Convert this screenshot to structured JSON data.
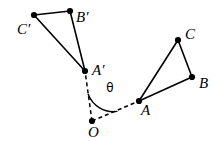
{
  "figure": {
    "background_color": "#ffffff",
    "stroke_color": "#000000",
    "width": 219,
    "height": 141
  },
  "labels": {
    "c_prime": "C′",
    "b_prime": "B′",
    "a_prime": "A′",
    "c": "C",
    "b": "B",
    "a": "A",
    "o": "O",
    "theta": "θ"
  },
  "points": {
    "C_prime": {
      "x": 34,
      "y": 15,
      "label": "C′",
      "label_x": 17,
      "label_y": 31
    },
    "B_prime": {
      "x": 70,
      "y": 11,
      "label": "B′",
      "label_x": 76,
      "label_y": 19
    },
    "A_prime": {
      "x": 85,
      "y": 71,
      "label": "A′",
      "label_x": 92,
      "label_y": 72
    },
    "C": {
      "x": 178,
      "y": 40,
      "label": "C",
      "label_x": 185,
      "label_y": 36
    },
    "B": {
      "x": 192,
      "y": 77,
      "label": "B",
      "label_x": 199,
      "label_y": 85
    },
    "A": {
      "x": 139,
      "y": 101,
      "label": "A",
      "label_x": 141,
      "label_y": 112
    },
    "O": {
      "x": 92,
      "y": 121,
      "label": "O",
      "label_x": 88,
      "label_y": 134
    }
  },
  "shapes": {
    "image_triangle": {
      "name": "triangle-a-prime-b-prime-c-prime",
      "vertices": [
        "A_prime",
        "B_prime",
        "C_prime"
      ],
      "style": "solid"
    },
    "preimage_triangle": {
      "name": "triangle-a-b-c",
      "vertices": [
        "A",
        "B",
        "C"
      ],
      "style": "solid"
    }
  },
  "rays": [
    {
      "name": "ray-o-to-a-prime",
      "from": "O",
      "to": "A_prime",
      "style": "dashed"
    },
    {
      "name": "ray-o-to-a",
      "from": "O",
      "to": "A",
      "style": "dashed"
    }
  ],
  "angle": {
    "name": "rotation-angle-theta",
    "symbol": "θ",
    "vertex": "O",
    "between": [
      "A_prime",
      "A"
    ],
    "label_x": 110,
    "label_y": 88,
    "arc_radius": 27
  }
}
